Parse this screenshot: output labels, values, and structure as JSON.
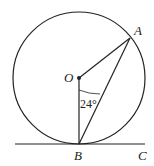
{
  "diagram": {
    "type": "circle-tangent-geometry",
    "points": {
      "O": {
        "label": "O",
        "x": 79,
        "y": 78
      },
      "A": {
        "label": "A",
        "x": 130,
        "y": 38
      },
      "B": {
        "label": "B",
        "x": 79,
        "y": 144
      },
      "C": {
        "label": "C",
        "x": 144,
        "y": 144
      }
    },
    "circle": {
      "center": "O",
      "radius": 66
    },
    "segments": [
      "OA",
      "OB",
      "AB",
      "BC (tangent line)"
    ],
    "angle": {
      "vertex": "B",
      "between": [
        "OB",
        "AB"
      ],
      "label": "24°"
    },
    "colors": {
      "stroke": "#222222",
      "background": "#ffffff"
    }
  }
}
